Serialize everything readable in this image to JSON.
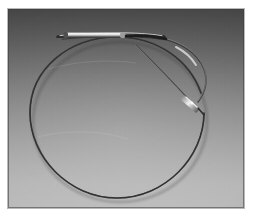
{
  "figure": {
    "kind": "photograph",
    "caption": "",
    "alt_text": "Grayscale photograph of a long flexible guidewire coiled into a single large circular loop on a gray graduated background. A straight proximal shaft with a bright cylindrical connector hub lies across the upper portion, curving to the right and down to a tapered, highlighted distal tip near the center-right."
  },
  "plate": {
    "label": "photo-plate",
    "background_top_color": "#4a4a4a",
    "background_bottom_color": "#bcbcbc",
    "border_color": "#b9b9b9",
    "page_color": "#ffffff",
    "left": 8,
    "top": 9,
    "width": 236,
    "height": 199
  },
  "objects": {
    "loop": {
      "name": "guidewire-loop",
      "description": "large circular coil of the wire",
      "stroke_color": "#3a3a3a",
      "stroke_width": 1.6,
      "center_x": 110,
      "center_y": 109,
      "radius_x": 87,
      "radius_y": 80
    },
    "shaft": {
      "name": "proximal-shaft",
      "description": "straight proximal section running across the top",
      "stroke_color": "#2f2f2f",
      "highlight_color": "#d8d8d8"
    },
    "hub": {
      "name": "connector-hub",
      "description": "bright cylindrical connector / strain relief on the proximal shaft",
      "highlight_color": "#e2e2e2",
      "shadow_color": "#1f1f1f"
    },
    "tip": {
      "name": "distal-tip",
      "description": "tapered distal tip with specular highlight",
      "highlight_color": "#efefef",
      "stroke_color": "#343434"
    }
  }
}
